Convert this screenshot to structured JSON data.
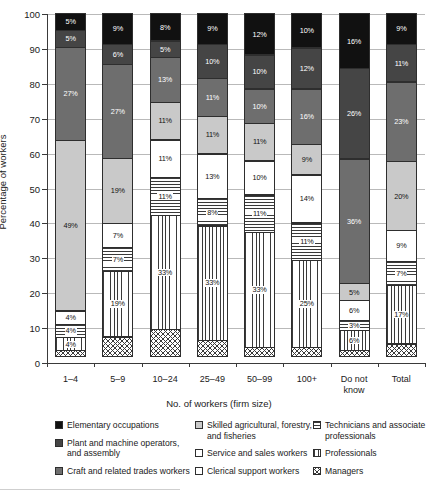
{
  "chart_data": {
    "type": "bar",
    "subtype": "stacked-column-100",
    "title": "",
    "xlabel": "No. of workers (firm size)",
    "ylabel": "Percentage of workers",
    "ylim": [
      0,
      100
    ],
    "ytick_step": 10,
    "yticks": [
      0,
      10,
      20,
      30,
      40,
      50,
      60,
      70,
      80,
      90,
      100
    ],
    "grid": true,
    "legend_position": "bottom",
    "units": "%",
    "categories": [
      "1–4",
      "5–9",
      "10–24",
      "25–49",
      "50–99",
      "100+",
      "Do not know",
      "Total"
    ],
    "stack_order": "top-to-bottom",
    "series": [
      {
        "name": "Elementary occupations",
        "icon": "solid-black-swatch",
        "color": "#111111",
        "fill": "solid",
        "tone": "dark",
        "values": [
          5,
          9,
          8,
          9,
          12,
          10,
          16,
          9
        ],
        "labels": [
          "5%",
          "9%",
          "8%",
          "9%",
          "12%",
          "10%",
          "16%",
          "9%"
        ]
      },
      {
        "name": "Plant and machine operators, and assembly",
        "icon": "dark-gray-swatch",
        "color": "#454545",
        "fill": "solid",
        "tone": "dark",
        "values": [
          5,
          6,
          5,
          10,
          10,
          12,
          26,
          11
        ],
        "labels": [
          "5%",
          "6%",
          "5%",
          "10%",
          "10%",
          "12%",
          "26%",
          "11%"
        ]
      },
      {
        "name": "Craft and related trades workers",
        "icon": "mid-gray-swatch",
        "color": "#6e6e6e",
        "fill": "solid",
        "tone": "dark",
        "values": [
          27,
          27,
          13,
          11,
          10,
          16,
          36,
          23
        ],
        "labels": [
          "27%",
          "27%",
          "13%",
          "11%",
          "10%",
          "16%",
          "36%",
          "23%"
        ]
      },
      {
        "name": "Skilled agricultural, forestry, and fisheries",
        "icon": "light-gray-swatch",
        "color": "#c9c9c9",
        "fill": "solid",
        "tone": "light",
        "values": [
          49,
          19,
          11,
          11,
          11,
          9,
          5,
          20
        ],
        "labels": [
          "49%",
          "19%",
          "11%",
          "11%",
          "11%",
          "9%",
          "5%",
          "20%"
        ]
      },
      {
        "name": "Service and sales workers",
        "icon": "white-swatch-thin-border",
        "color": "#ffffff",
        "fill": "solid",
        "tone": "light",
        "values": [
          4,
          7,
          11,
          13,
          10,
          14,
          6,
          9
        ],
        "labels": [
          "4%",
          "7%",
          "11%",
          "13%",
          "10%",
          "14%",
          "6%",
          "9%"
        ]
      },
      {
        "name": "Technicians and associate professionals",
        "icon": "horizontal-stripe-swatch",
        "color": "#3a3a3a",
        "fill": "horizontal-stripes",
        "tone": "light",
        "values": [
          4,
          7,
          11,
          8,
          11,
          11,
          3,
          7
        ],
        "labels": [
          "4%",
          "7%",
          "11%",
          "8%",
          "11%",
          "11%",
          "3%",
          "7%"
        ]
      },
      {
        "name": "Professionals",
        "icon": "vertical-stripe-swatch",
        "color": "#3a3a3a",
        "fill": "vertical-stripes",
        "tone": "light",
        "values": [
          4,
          19,
          33,
          33,
          33,
          25,
          6,
          17
        ],
        "labels": [
          "4%",
          "19%",
          "33%",
          "33%",
          "33%",
          "25%",
          "6%",
          "17%"
        ]
      },
      {
        "name": "Clerical support workers",
        "icon": "white-swatch",
        "color": "#ffffff",
        "fill": "solid",
        "tone": "light",
        "values": [
          0,
          0,
          0,
          0,
          0,
          0,
          0,
          0
        ],
        "labels": [
          "",
          "",
          "",
          "",
          "",
          "",
          "",
          ""
        ]
      },
      {
        "name": "Managers",
        "icon": "crosshatch-swatch",
        "color": "#3a3a3a",
        "fill": "crosshatch",
        "tone": "light",
        "values": [
          2,
          6,
          8,
          5,
          3,
          3,
          2,
          4
        ],
        "labels": [
          "",
          "",
          "",
          "",
          "",
          "",
          "",
          ""
        ]
      }
    ]
  },
  "axes": {
    "y_title": "Percentage of workers",
    "x_title": "No. of workers (firm size)",
    "y_tick_labels": [
      "100",
      "90",
      "80",
      "70",
      "60",
      "50",
      "40",
      "30",
      "20",
      "10",
      "0"
    ],
    "x_tick_labels": [
      {
        "line1": "1–4",
        "line2": ""
      },
      {
        "line1": "5–9",
        "line2": ""
      },
      {
        "line1": "10–24",
        "line2": ""
      },
      {
        "line1": "25–49",
        "line2": ""
      },
      {
        "line1": "50–99",
        "line2": ""
      },
      {
        "line1": "100+",
        "line2": ""
      },
      {
        "line1": "Do not",
        "line2": "know"
      },
      {
        "line1": "Total",
        "line2": ""
      }
    ]
  },
  "legend": {
    "columns": [
      [
        {
          "label": "Elementary occupations",
          "swatch": "solid-black-swatch"
        },
        {
          "label": "Plant and machine operators, and assembly",
          "swatch": "dark-gray-swatch"
        },
        {
          "label": "Craft and related trades workers",
          "swatch": "mid-gray-swatch"
        }
      ],
      [
        {
          "label": "Skilled agricultural, forestry, and fisheries",
          "swatch": "light-gray-swatch"
        },
        {
          "label": "Service and sales workers",
          "swatch": "white-swatch-thin-border"
        },
        {
          "label": "Clerical support workers",
          "swatch": "white-swatch"
        }
      ],
      [
        {
          "label": "Technicians and associate professionals",
          "swatch": "horizontal-stripe-swatch"
        },
        {
          "label": "Professionals",
          "swatch": "vertical-stripe-swatch"
        },
        {
          "label": "Managers",
          "swatch": "crosshatch-swatch"
        }
      ]
    ]
  }
}
